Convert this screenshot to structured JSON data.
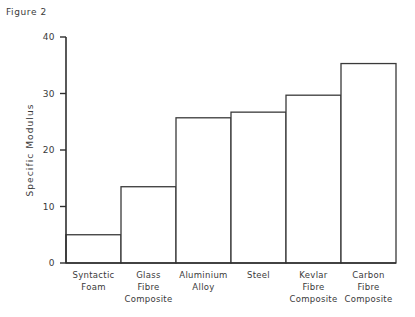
{
  "figure": {
    "caption": "Figure 2"
  },
  "chart_data": {
    "type": "bar",
    "title": "",
    "xlabel": "",
    "ylabel": "Specific Modulus",
    "ylim": [
      0,
      40
    ],
    "yticks": [
      0,
      10,
      20,
      30,
      40
    ],
    "ytick_labels": [
      "0",
      "10",
      "20",
      "30",
      "40"
    ],
    "grid": false,
    "legend": "none",
    "bar_style": "outline",
    "bar_fill": "#ffffff",
    "bar_edge": "#3a3a3a",
    "categories": [
      "Syntactic Foam",
      "Glass Fibre Composite",
      "Aluminium Alloy",
      "Steel",
      "Kevlar Fibre Composite",
      "Carbon Fibre Composite"
    ],
    "category_lines": [
      [
        "Syntactic",
        "Foam"
      ],
      [
        "Glass",
        "Fibre",
        "Composite"
      ],
      [
        "Aluminium",
        "Alloy"
      ],
      [
        "Steel"
      ],
      [
        "Kevlar",
        "Fibre",
        "Composite"
      ],
      [
        "Carbon",
        "Fibre",
        "Composite"
      ]
    ],
    "values": [
      5.0,
      13.5,
      25.7,
      26.7,
      29.7,
      35.3
    ]
  }
}
